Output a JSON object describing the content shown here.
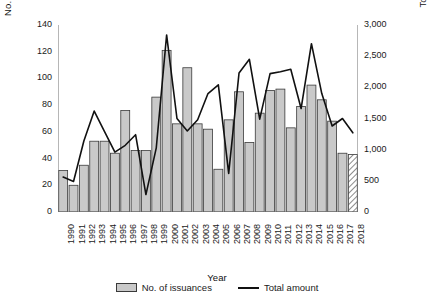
{
  "chart_data": {
    "type": "bar",
    "title": "",
    "xlabel": "Year",
    "ylabel": "No. of issuances",
    "y2label": "Total amount (JPY billions)",
    "ylim": [
      0,
      140
    ],
    "y2lim": [
      0,
      3000
    ],
    "grid": false,
    "legend_position": "bottom",
    "categories": [
      "1990",
      "1991",
      "1992",
      "1993",
      "1994",
      "1995",
      "1996",
      "1997",
      "1998",
      "1999",
      "2000",
      "2001",
      "2002",
      "2003",
      "2004",
      "2005",
      "2006",
      "2007",
      "2008",
      "2009",
      "2010",
      "2011",
      "2012",
      "2013",
      "2014",
      "2015",
      "2016",
      "2017",
      "2018"
    ],
    "yticks": [
      0,
      20,
      40,
      60,
      80,
      100,
      120,
      140
    ],
    "ytick_labels": [
      "0",
      "20",
      "40",
      "60",
      "80",
      "100",
      "120",
      "140"
    ],
    "y2ticks": [
      0,
      500,
      1000,
      1500,
      2000,
      2500,
      3000
    ],
    "y2tick_labels": [
      "0",
      "500",
      "1,000",
      "1,500",
      "2,000",
      "2,500",
      "3,000"
    ],
    "series": [
      {
        "name": "No. of issuances",
        "type": "bar",
        "axis": "left",
        "fill": "#c9c9c9",
        "edge": "#3a3a3a",
        "values": [
          31,
          20,
          35,
          53,
          53,
          44,
          76,
          46,
          46,
          86,
          121,
          66,
          108,
          66,
          62,
          32,
          69,
          90,
          52,
          74,
          91,
          92,
          63,
          79,
          95,
          84,
          68,
          44,
          43
        ],
        "hatched_categories": [
          "2018"
        ]
      },
      {
        "name": "Total amount",
        "type": "line",
        "axis": "right",
        "color": "#111111",
        "values": [
          560,
          490,
          1140,
          1620,
          1290,
          960,
          1070,
          1240,
          280,
          1030,
          2840,
          1500,
          1300,
          1480,
          1900,
          2040,
          620,
          2230,
          2450,
          1490,
          2220,
          2250,
          2290,
          1660,
          2700,
          1900,
          1380,
          1500,
          1270
        ]
      }
    ]
  },
  "legend": {
    "bar_label": "No. of issuances",
    "line_label": "Total amount"
  }
}
